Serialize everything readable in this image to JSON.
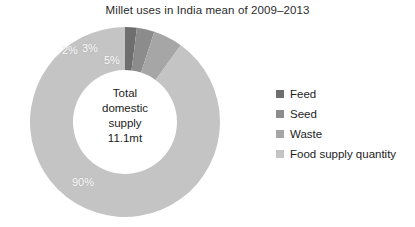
{
  "chart_data": {
    "type": "pie",
    "variant": "donut",
    "title": "Millet uses in India mean of 2009–2013",
    "categories": [
      "Feed",
      "Seed",
      "Waste",
      "Food supply quantity"
    ],
    "values": [
      2,
      3,
      5,
      90
    ],
    "value_labels": [
      "2%",
      "3%",
      "5%",
      "90%"
    ],
    "units": "percent",
    "colors": [
      "#6e6e6e",
      "#8c8c8c",
      "#a6a6a6",
      "#c4c4c4"
    ],
    "start_angle_deg": 0,
    "direction": "clockwise",
    "legend": {
      "position": "right",
      "entries": [
        {
          "label": "Feed",
          "color": "#6e6e6e"
        },
        {
          "label": "Seed",
          "color": "#8c8c8c"
        },
        {
          "label": "Waste",
          "color": "#a6a6a6"
        },
        {
          "label": "Food supply quantity",
          "color": "#c4c4c4"
        }
      ]
    },
    "center_annotation": {
      "line1": "Total",
      "line2": "domestic",
      "line3": "supply",
      "line4": "11.1mt"
    },
    "grid": false,
    "xlabel": "",
    "ylabel": ""
  },
  "background_color": "#ffffff",
  "label_text_color": "#ffffff"
}
